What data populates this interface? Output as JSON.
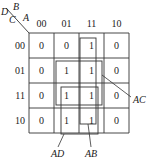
{
  "corner": {
    "var_b": "B",
    "var_a": "A",
    "var_d": "D",
    "var_c": "C"
  },
  "col_headers": [
    "00",
    "01",
    "11",
    "10"
  ],
  "row_headers": [
    "00",
    "01",
    "11",
    "10"
  ],
  "cells": [
    [
      "0",
      "0",
      "1",
      "0"
    ],
    [
      "0",
      "1",
      "1",
      "0"
    ],
    [
      "0",
      "1",
      "1",
      "0"
    ],
    [
      "0",
      "1",
      "1",
      "0"
    ]
  ],
  "groups": [
    {
      "label": "AB",
      "rows": [
        0,
        3
      ],
      "cols": [
        2,
        2
      ]
    },
    {
      "label": "AC",
      "rows": [
        1,
        2
      ],
      "cols": [
        1,
        2
      ]
    },
    {
      "label": "AD",
      "rows": [
        2,
        3
      ],
      "cols": [
        1,
        2
      ]
    }
  ],
  "colors": {
    "line": "#333333",
    "background": "#ffffff"
  }
}
